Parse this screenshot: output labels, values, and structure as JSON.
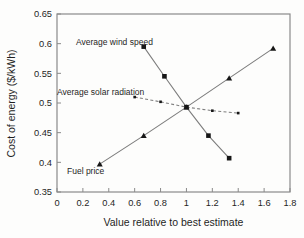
{
  "chart_data": {
    "type": "line",
    "title": "",
    "xlabel": "Value relative to best estimate",
    "ylabel": "Cost of energy ($/kWh)",
    "xlim": [
      0,
      1.8
    ],
    "ylim": [
      0.35,
      0.65
    ],
    "grid": false,
    "legend": "inline-labels",
    "xtick_values": [
      0,
      0.2,
      0.4,
      0.6,
      0.8,
      1,
      1.2,
      1.4,
      1.6,
      1.8
    ],
    "xtick_labels": [
      "0",
      "0.2",
      "0.4",
      "0.6",
      "0.8",
      "1",
      "1.2",
      "1.4",
      "1.6",
      "1.8"
    ],
    "ytick_values": [
      0.35,
      0.4,
      0.45,
      0.5,
      0.55,
      0.6,
      0.65
    ],
    "ytick_labels": [
      "0.35",
      "0.4",
      "0.45",
      "0.5",
      "0.55",
      "0.6",
      "0.65"
    ],
    "series": [
      {
        "name": "Average wind speed",
        "marker": "square",
        "line": "solid",
        "x": [
          0.67,
          0.83,
          1,
          1.17,
          1.33
        ],
        "y": [
          0.595,
          0.545,
          0.493,
          0.445,
          0.407
        ]
      },
      {
        "name": "Average solar radiation",
        "marker": "dot",
        "line": "dashed",
        "x": [
          0.6,
          0.8,
          1,
          1.2,
          1.4
        ],
        "y": [
          0.51,
          0.502,
          0.493,
          0.487,
          0.483
        ]
      },
      {
        "name": "Fuel price",
        "marker": "triangle",
        "line": "solid",
        "x": [
          0.33,
          0.67,
          1,
          1.33,
          1.67
        ],
        "y": [
          0.397,
          0.445,
          0.493,
          0.542,
          0.592
        ]
      }
    ],
    "colors": {
      "line": "#7d7d7d",
      "marker": "#161616",
      "frame": "#8a8a8a",
      "text": "#1f1f1f",
      "background": "#fdfdfc"
    }
  }
}
